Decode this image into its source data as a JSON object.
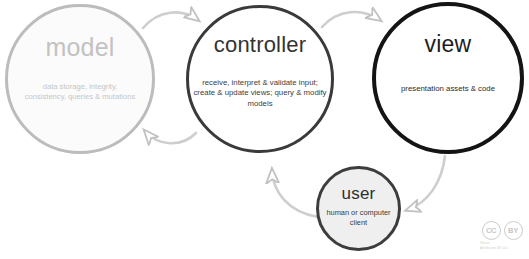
{
  "diagram": {
    "background_color": "#ffffff",
    "nodes": [
      {
        "id": "model",
        "title": "model",
        "description": "data storage, integrity, consistency, queries & mutations",
        "border_color": "#bcbcbc",
        "fill_color": "#fbfbfb",
        "text_color": "#c2c2c2"
      },
      {
        "id": "controller",
        "title": "controller",
        "description": "receive, interpret & validate input; create & update views; query & modify models",
        "border_color": "#3a3a3a",
        "fill_color": "#ffffff",
        "text_color": "#333333"
      },
      {
        "id": "view",
        "title": "view",
        "description": "presentation assets & code",
        "border_color": "#141414",
        "fill_color": "#ffffff",
        "text_color": "#1d1d1d"
      },
      {
        "id": "user",
        "title": "user",
        "description": "human or computer client",
        "border_color": "#3d3d3d",
        "fill_color": "#efefef",
        "text_color": "#2e2e2e"
      }
    ],
    "connections": [
      {
        "id": "model-to-controller",
        "from": "model",
        "to": "controller",
        "direction": "right",
        "position": "top",
        "color": "#c9c9c9"
      },
      {
        "id": "controller-to-model",
        "from": "controller",
        "to": "model",
        "direction": "left",
        "position": "bottom",
        "color": "#c9c9c9"
      },
      {
        "id": "controller-to-view",
        "from": "controller",
        "to": "view",
        "direction": "right",
        "position": "top",
        "color": "#c9c9c9"
      },
      {
        "id": "user-to-controller",
        "from": "user",
        "to": "controller",
        "direction": "up-left",
        "position": "left",
        "color": "#c9c9c9"
      },
      {
        "id": "view-to-user",
        "from": "view",
        "to": "user",
        "direction": "down-left",
        "position": "right",
        "color": "#c9c9c9"
      }
    ]
  },
  "license_badge": {
    "cc_label": "CC",
    "by_label": "BY",
    "microtext_line1": "Share",
    "microtext_line2": "Attribution BY-4.0"
  }
}
